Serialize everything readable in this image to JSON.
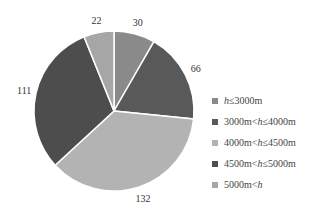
{
  "chart_data": {
    "type": "pie",
    "title": "",
    "start_angle": "12 o'clock",
    "direction": "clockwise",
    "categories": [
      "h≤3000m",
      "3000m<h≤4000m",
      "4000m<h≤4500m",
      "4500m<h≤5000m",
      "5000m<h"
    ],
    "values": [
      30,
      66,
      132,
      111,
      22
    ],
    "data_labels": [
      "30",
      "66",
      "132",
      "111",
      "22"
    ],
    "colors": [
      "#8a8a8a",
      "#595959",
      "#b3b3b3",
      "#4d4d4d",
      "#a6a6a6"
    ],
    "legend_position": "right",
    "total": 361
  },
  "legend": {
    "items": [
      {
        "pre": "",
        "var": "h",
        "post": "≤3000m",
        "color": "#8a8a8a"
      },
      {
        "pre": "3000m<",
        "var": "h",
        "post": "≤4000m",
        "color": "#595959"
      },
      {
        "pre": "4000m<",
        "var": "h",
        "post": "≤4500m",
        "color": "#b3b3b3"
      },
      {
        "pre": "4500m<",
        "var": "h",
        "post": "≤5000m",
        "color": "#4d4d4d"
      },
      {
        "pre": "5000m<",
        "var": "h",
        "post": "",
        "color": "#a6a6a6"
      }
    ]
  }
}
